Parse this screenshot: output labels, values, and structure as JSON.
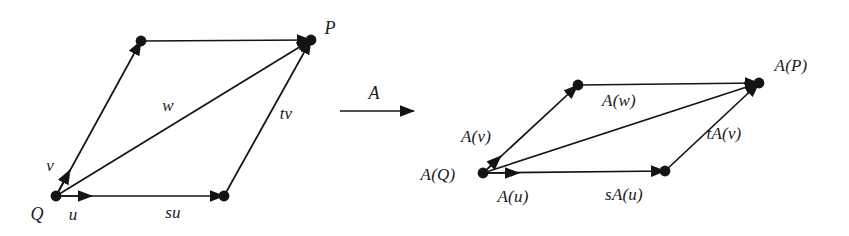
{
  "figure": {
    "stroke_color": "#141414",
    "background_color": "#ffffff",
    "vertex_radius": 5.2
  },
  "source": {
    "name": "source-parallelogram",
    "vertices": {
      "Q": {
        "x": 56,
        "y": 196
      },
      "top_left": {
        "x": 141,
        "y": 41
      },
      "P": {
        "x": 311,
        "y": 40
      },
      "bottom_right": {
        "x": 224,
        "y": 196
      }
    },
    "labels": {
      "Q": {
        "text": "Q",
        "x": 37,
        "y": 214
      },
      "P": {
        "text": "P",
        "x": 330,
        "y": 28
      },
      "u": {
        "text": "u",
        "x": 73,
        "y": 214
      },
      "v": {
        "text": "v",
        "x": 50,
        "y": 165
      },
      "w": {
        "text": "w",
        "x": 168,
        "y": 105
      },
      "su": {
        "text": "su",
        "x": 173,
        "y": 212
      },
      "tv": {
        "text": "tv",
        "x": 286,
        "y": 113
      }
    }
  },
  "map_arrow": {
    "label": "A",
    "label_x": 374,
    "label_y": 93,
    "x1": 340,
    "y1": 111,
    "x2": 414,
    "y2": 111
  },
  "image": {
    "name": "image-parallelogram",
    "vertices": {
      "AQ": {
        "x": 483,
        "y": 173
      },
      "top_left": {
        "x": 578,
        "y": 85
      },
      "AP": {
        "x": 759,
        "y": 83
      },
      "bottom_right": {
        "x": 665,
        "y": 171
      }
    },
    "labels": {
      "AQ": {
        "text": "A(Q)",
        "x": 438,
        "y": 174
      },
      "AP": {
        "text": "A(P)",
        "x": 791,
        "y": 65
      },
      "Au": {
        "text": "A(u)",
        "x": 513,
        "y": 196
      },
      "Av": {
        "text": "A(v)",
        "x": 476,
        "y": 136
      },
      "Aw": {
        "text": "A(w)",
        "x": 619,
        "y": 100
      },
      "sAu": {
        "text": "sA(u)",
        "x": 624,
        "y": 194
      },
      "tAv": {
        "text": "tA(v)",
        "x": 724,
        "y": 133
      }
    }
  }
}
